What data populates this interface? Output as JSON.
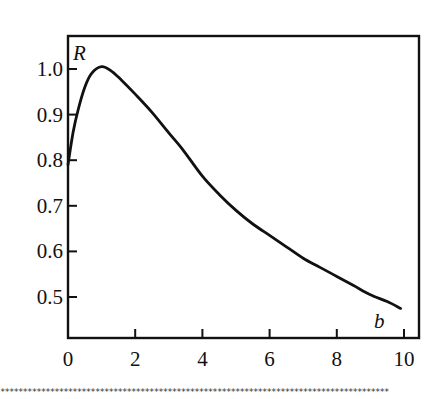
{
  "chart_data": {
    "type": "line",
    "title": "",
    "xlabel": "b",
    "ylabel": "R",
    "xlim": [
      0,
      10.4
    ],
    "ylim": [
      0.41,
      1.07
    ],
    "x_ticks": [
      0,
      2,
      4,
      6,
      8,
      10
    ],
    "x_tick_labels": [
      "0",
      "2",
      "4",
      "6",
      "8",
      "10"
    ],
    "y_ticks": [
      0.5,
      0.6,
      0.7,
      0.8,
      0.9,
      1.0
    ],
    "y_tick_labels": [
      "0.5",
      "0.6",
      "0.7",
      "0.8",
      "0.9",
      "1.0"
    ],
    "grid": false,
    "legend": null,
    "series": [
      {
        "name": "R(b)",
        "x": [
          0,
          0.15,
          0.3,
          0.5,
          0.7,
          1.0,
          1.3,
          1.6,
          2.0,
          2.5,
          3.0,
          3.4,
          4.0,
          4.5,
          5.0,
          5.5,
          6.0,
          6.5,
          7.0,
          7.5,
          8.0,
          8.5,
          9.0,
          9.5,
          9.9
        ],
        "y": [
          0.79,
          0.86,
          0.91,
          0.96,
          0.99,
          1.005,
          0.995,
          0.975,
          0.945,
          0.905,
          0.86,
          0.825,
          0.765,
          0.725,
          0.69,
          0.66,
          0.635,
          0.61,
          0.585,
          0.565,
          0.545,
          0.525,
          0.505,
          0.49,
          0.475
        ]
      }
    ]
  },
  "decor": {
    "bottom_rule": "**************************************************************************************"
  }
}
